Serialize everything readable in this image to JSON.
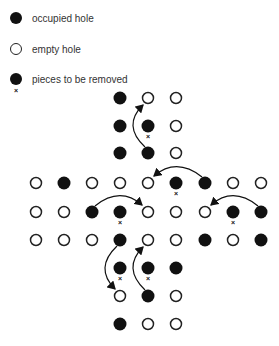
{
  "legend": {
    "items": [
      {
        "symbol": "filled",
        "label": "occupied hole"
      },
      {
        "symbol": "empty",
        "label": "empty hole"
      },
      {
        "symbol": "removed",
        "label": "pieces to be removed"
      }
    ]
  },
  "colors": {
    "peg": "#111111",
    "outline": "#222222",
    "background": "#ffffff"
  },
  "board": {
    "grid_x": [
      36,
      64,
      92,
      120,
      148,
      176,
      205,
      233,
      261
    ],
    "holes": [
      {
        "x": 120,
        "y": 98,
        "state": "filled"
      },
      {
        "x": 148,
        "y": 98,
        "state": "empty"
      },
      {
        "x": 176,
        "y": 98,
        "state": "empty"
      },
      {
        "x": 120,
        "y": 126,
        "state": "filled"
      },
      {
        "x": 148,
        "y": 126,
        "state": "removed"
      },
      {
        "x": 176,
        "y": 126,
        "state": "empty"
      },
      {
        "x": 120,
        "y": 153,
        "state": "filled"
      },
      {
        "x": 148,
        "y": 153,
        "state": "filled"
      },
      {
        "x": 176,
        "y": 153,
        "state": "empty"
      },
      {
        "x": 36,
        "y": 183,
        "state": "empty"
      },
      {
        "x": 64,
        "y": 183,
        "state": "filled"
      },
      {
        "x": 92,
        "y": 183,
        "state": "empty"
      },
      {
        "x": 120,
        "y": 183,
        "state": "empty"
      },
      {
        "x": 148,
        "y": 183,
        "state": "empty"
      },
      {
        "x": 176,
        "y": 183,
        "state": "removed"
      },
      {
        "x": 205,
        "y": 183,
        "state": "filled"
      },
      {
        "x": 233,
        "y": 183,
        "state": "empty"
      },
      {
        "x": 261,
        "y": 183,
        "state": "empty"
      },
      {
        "x": 36,
        "y": 212,
        "state": "empty"
      },
      {
        "x": 64,
        "y": 212,
        "state": "empty"
      },
      {
        "x": 92,
        "y": 212,
        "state": "filled"
      },
      {
        "x": 120,
        "y": 212,
        "state": "removed"
      },
      {
        "x": 148,
        "y": 212,
        "state": "empty"
      },
      {
        "x": 176,
        "y": 212,
        "state": "empty"
      },
      {
        "x": 205,
        "y": 212,
        "state": "empty"
      },
      {
        "x": 233,
        "y": 212,
        "state": "removed"
      },
      {
        "x": 261,
        "y": 212,
        "state": "filled"
      },
      {
        "x": 36,
        "y": 240,
        "state": "empty"
      },
      {
        "x": 64,
        "y": 240,
        "state": "empty"
      },
      {
        "x": 92,
        "y": 240,
        "state": "empty"
      },
      {
        "x": 120,
        "y": 240,
        "state": "filled"
      },
      {
        "x": 148,
        "y": 240,
        "state": "empty"
      },
      {
        "x": 176,
        "y": 240,
        "state": "empty"
      },
      {
        "x": 205,
        "y": 240,
        "state": "filled"
      },
      {
        "x": 233,
        "y": 240,
        "state": "empty"
      },
      {
        "x": 261,
        "y": 240,
        "state": "filled"
      },
      {
        "x": 120,
        "y": 268,
        "state": "removed"
      },
      {
        "x": 148,
        "y": 268,
        "state": "removed"
      },
      {
        "x": 176,
        "y": 268,
        "state": "filled"
      },
      {
        "x": 120,
        "y": 296,
        "state": "empty"
      },
      {
        "x": 148,
        "y": 296,
        "state": "filled"
      },
      {
        "x": 176,
        "y": 296,
        "state": "empty"
      },
      {
        "x": 120,
        "y": 324,
        "state": "filled"
      },
      {
        "x": 148,
        "y": 324,
        "state": "empty"
      },
      {
        "x": 176,
        "y": 324,
        "state": "empty"
      }
    ],
    "moves": [
      {
        "from": [
          148,
          153
        ],
        "to": [
          148,
          98
        ],
        "side": "left"
      },
      {
        "from": [
          205,
          183
        ],
        "to": [
          148,
          183
        ],
        "side": "up"
      },
      {
        "from": [
          92,
          212
        ],
        "to": [
          148,
          212
        ],
        "side": "up"
      },
      {
        "from": [
          261,
          212
        ],
        "to": [
          205,
          212
        ],
        "side": "up"
      },
      {
        "from": [
          120,
          240
        ],
        "to": [
          120,
          296
        ],
        "side": "left"
      },
      {
        "from": [
          148,
          296
        ],
        "to": [
          148,
          240
        ],
        "side": "left"
      }
    ]
  }
}
